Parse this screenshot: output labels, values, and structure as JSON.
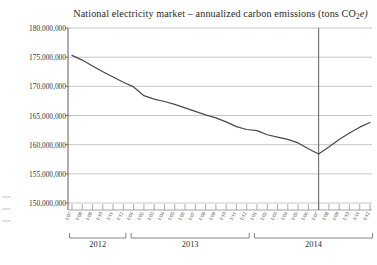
{
  "chart_data": {
    "type": "line",
    "title": "National electricity market – annualized carbon emissions (tons CO2e)",
    "title_prefix": "National electricity market – annualized carbon emissions (tons CO",
    "title_sub": "2",
    "title_suffix": "e)",
    "xlabel": "",
    "ylabel": "",
    "ylim": [
      150000000,
      180000000
    ],
    "ytick_step": 5000000,
    "grid": true,
    "legend": false,
    "ytick_labels": [
      "180,000,000",
      "175,000,000",
      "170,000,000",
      "165,000,000",
      "160,000,000",
      "155,000,000",
      "150,000,000"
    ],
    "ytick_values": [
      180000000,
      175000000,
      170000000,
      165000000,
      160000000,
      155000000,
      150000000
    ],
    "year_bands": [
      {
        "label": "2012",
        "start_index": 0,
        "end_index": 5
      },
      {
        "label": "2013",
        "start_index": 6,
        "end_index": 17
      },
      {
        "label": "2014",
        "start_index": 18,
        "end_index": 29
      }
    ],
    "annotations": [
      {
        "name": "vertical-marker-line",
        "x_index": 24,
        "label": ""
      }
    ],
    "categories": [
      "1/07",
      "1/08",
      "1/09",
      "1/10",
      "1/11",
      "1/12",
      "1/01",
      "1/02",
      "1/03",
      "1/04",
      "1/05",
      "1/06",
      "1/07",
      "1/08",
      "1/09",
      "1/10",
      "1/11",
      "1/12",
      "1/01",
      "1/02",
      "1/03",
      "1/04",
      "1/05",
      "1/06",
      "1/07",
      "1/08",
      "1/09",
      "1/10",
      "1/11",
      "1/12"
    ],
    "series": [
      {
        "name": "Annualized carbon emissions",
        "color": "#4a4a4a",
        "values": [
          175300000,
          174500000,
          173500000,
          172500000,
          171600000,
          170700000,
          169900000,
          168400000,
          167800000,
          167400000,
          166900000,
          166300000,
          165700000,
          165100000,
          164600000,
          163900000,
          163100000,
          162600000,
          162400000,
          161700000,
          161300000,
          160900000,
          160300000,
          159300000,
          158400000,
          159600000,
          160900000,
          162000000,
          163000000,
          163800000
        ]
      }
    ]
  }
}
